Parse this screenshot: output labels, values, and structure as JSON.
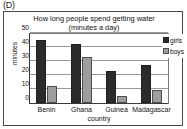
{
  "panel": {
    "label": "(D)"
  },
  "chart_data": {
    "type": "bar",
    "title": "How long people spend getting water",
    "subtitle": "(minutes a day)",
    "xlabel": "country",
    "ylabel": "minutes",
    "categories": [
      "Benin",
      "Ghana",
      "Guinea",
      "Madagascar"
    ],
    "series": [
      {
        "name": "girls",
        "color": "#2b2b2b",
        "values": [
          45,
          42,
          23,
          27
        ]
      },
      {
        "name": "boys",
        "color": "#9d9d9d",
        "values": [
          12,
          33,
          5,
          9
        ]
      }
    ],
    "ylim": [
      0,
      50
    ],
    "yticks": [
      0,
      10,
      20,
      30,
      40,
      50
    ],
    "grid": true,
    "legend_position": "right"
  }
}
